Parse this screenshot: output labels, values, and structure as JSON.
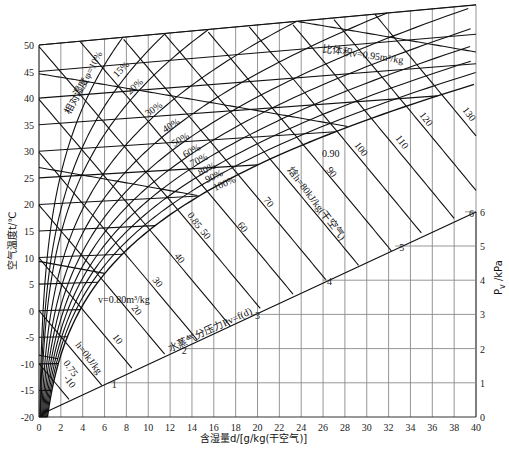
{
  "chart_data": {
    "type": "line",
    "xlabel": "含湿量d/[g/kg(干空气)]",
    "ylabel": "空气温度t/℃",
    "y2label": "Pv /kPa",
    "xlim": [
      0,
      40
    ],
    "ylim": [
      -20,
      50
    ],
    "y2lim": [
      0,
      6
    ],
    "x_ticks": [
      0,
      2,
      4,
      6,
      8,
      10,
      12,
      14,
      16,
      18,
      20,
      22,
      24,
      26,
      28,
      30,
      32,
      34,
      36,
      38,
      40
    ],
    "y_ticks": [
      -20,
      -15,
      -10,
      -5,
      0,
      5,
      10,
      15,
      20,
      25,
      30,
      35,
      40,
      45,
      50
    ],
    "y2_ticks": [
      0,
      1,
      2,
      3,
      4,
      5,
      6
    ],
    "grid": true,
    "relative_humidity_curves_percent": [
      10,
      15,
      20,
      30,
      40,
      50,
      60,
      70,
      80,
      90,
      100
    ],
    "enthalpy_lines_kJ_per_kg": [
      -10,
      0,
      10,
      20,
      30,
      40,
      50,
      60,
      70,
      80,
      90,
      100,
      110,
      120,
      130
    ],
    "specific_volume_lines_m3_per_kg": [
      0.75,
      0.8,
      0.85,
      0.9,
      0.95
    ],
    "vapor_pressure_line": {
      "label": "水蒸气分压力 Pv=f(d)",
      "points_d_kPa": [
        [
          0,
          0
        ],
        [
          6.3,
          1
        ],
        [
          12.7,
          2
        ],
        [
          19.4,
          3
        ],
        [
          26.0,
          4
        ],
        [
          32.6,
          5
        ],
        [
          39.0,
          6
        ]
      ]
    },
    "annotations": [
      "相对湿度φ=10%",
      "15%",
      "20%",
      "30%",
      "40%",
      "50%",
      "60%",
      "70%",
      "80%",
      "90%",
      "100%",
      "比体积v=0.95m³/kg",
      "v=0.80m³/kg",
      "0.75",
      "0.85",
      "0.90",
      "焓h=80kJ/kg(干空气)",
      "h=0kJ/kg",
      "-10",
      "10",
      "20",
      "30",
      "40",
      "50",
      "60",
      "70",
      "90",
      "100",
      "110",
      "120",
      "130",
      "水蒸气分压力Pv=f(d)"
    ]
  },
  "labels": {
    "xlabel": "含湿量d/[g/kg(干空气)]",
    "ylabel": "空气温度t/℃",
    "y2label": "P",
    "y2label_sub": "v",
    "y2label_unit": " /kPa",
    "rh10": "相对湿度φ=10%",
    "rh15": "15%",
    "rh20": "20%",
    "rh30": "30%",
    "rh40": "40%",
    "rh50": "50%",
    "rh60": "60%",
    "rh70": "70%",
    "rh80": "80%",
    "rh90": "90%",
    "rh100": "100%",
    "v095": "比体积v=0.95m³/kg",
    "v090": "0.90",
    "v085": "0.85",
    "v080": "v=0.80m³/kg",
    "v075": "0.75",
    "h80": "焓h=80kJ/kg(干空气)",
    "h0": "h=0kJ/kg",
    "hm10": "-10",
    "h10": "10",
    "h20": "20",
    "h30": "30",
    "h40": "40",
    "h50": "50",
    "h60": "60",
    "h70": "70",
    "h90": "90",
    "h100": "100",
    "h110": "110",
    "h120": "120",
    "h130": "130",
    "pv_line": "水蒸气分压力Pv=f(d)"
  }
}
